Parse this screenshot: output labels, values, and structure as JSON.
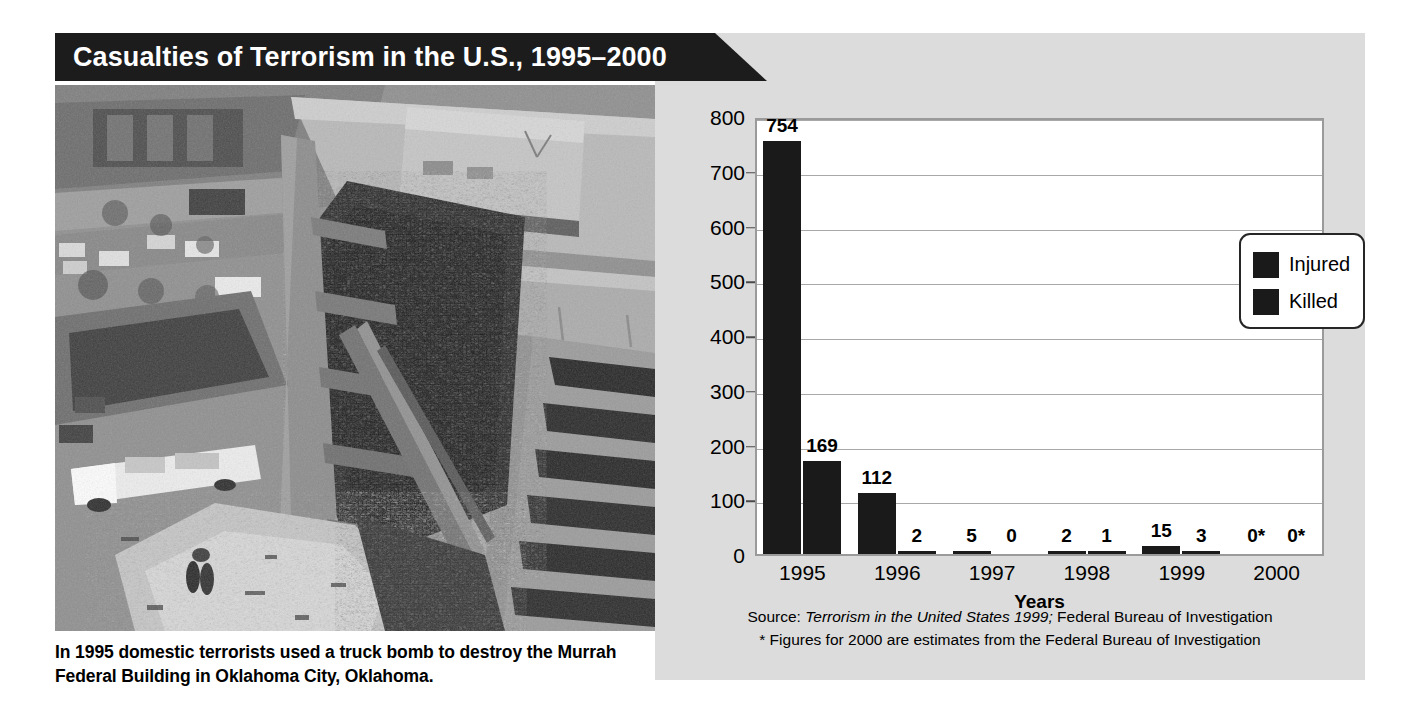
{
  "title": {
    "text": "Casualties of Terrorism in the U.S., 1995–2000"
  },
  "photo": {
    "alt": "aerial-photo-murrah-federal-building-bombing",
    "caption": "In 1995 domestic terrorists used a truck bomb to destroy the Murrah Federal Building in Oklahoma City, Oklahoma."
  },
  "source": {
    "line1_prefix": "Source: ",
    "line1_italic": "Terrorism in the United States 1999;",
    "line1_suffix": " Federal Bureau of Investigation",
    "line2": "* Figures for 2000 are estimates from the Federal Bureau of Investigation"
  },
  "legend": {
    "items": [
      {
        "label": "Injured",
        "color": "#1a1a1a"
      },
      {
        "label": "Killed",
        "color": "#1a1a1a"
      }
    ]
  },
  "chart_data": {
    "type": "bar",
    "title": "Casualties of Terrorism in the U.S., 1995–2000",
    "xlabel": "Years",
    "ylabel": "",
    "ylim": [
      0,
      800
    ],
    "yticks": [
      0,
      100,
      200,
      300,
      400,
      500,
      600,
      700,
      800
    ],
    "grid": true,
    "legend_position": "top-right-inside",
    "categories": [
      "1995",
      "1996",
      "1997",
      "1998",
      "1999",
      "2000"
    ],
    "series": [
      {
        "name": "Injured",
        "color": "#1a1a1a",
        "values": [
          754,
          112,
          5,
          2,
          15,
          0
        ],
        "labels": [
          "754",
          "112",
          "5",
          "2",
          "15",
          "0*"
        ]
      },
      {
        "name": "Killed",
        "color": "#1a1a1a",
        "values": [
          169,
          2,
          0,
          1,
          3,
          0
        ],
        "labels": [
          "169",
          "2",
          "0",
          "1",
          "3",
          "0*"
        ]
      }
    ],
    "annotations": [
      "Source: Terrorism in the United States 1999; Federal Bureau of Investigation",
      "* Figures for 2000 are estimates from the Federal Bureau of Investigation"
    ]
  }
}
